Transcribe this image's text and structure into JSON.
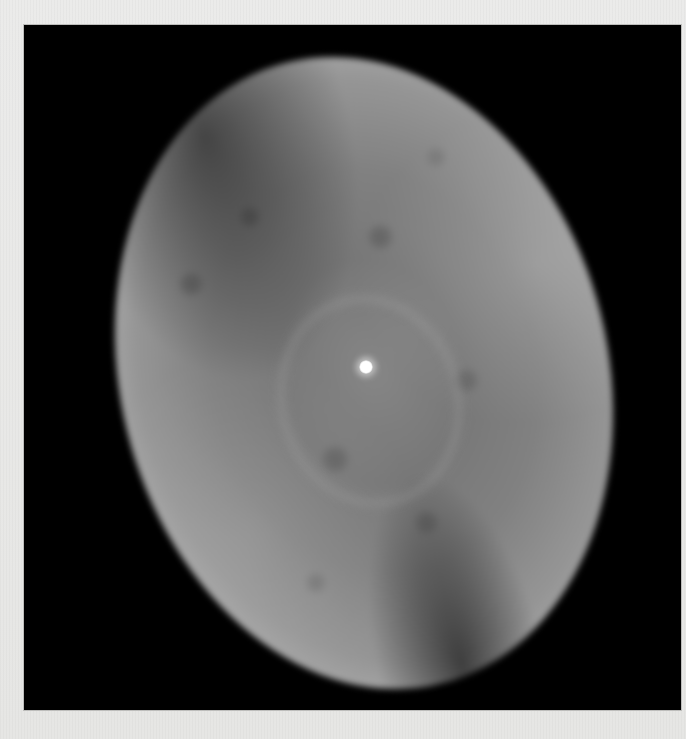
{
  "image": {
    "subject": "planetary nebula",
    "description": "Grayscale photograph of an elliptical planetary nebula with a bright central star on a black background, printed on light gray paper",
    "colors": {
      "paper": "#e9e9e7",
      "background": "#000000",
      "nebula_rim": "#c6c6c6",
      "nebula_interior": "#7b7b7b",
      "central_star": "#ffffff"
    }
  }
}
